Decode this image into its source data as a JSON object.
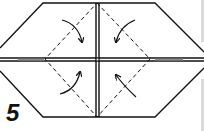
{
  "diagram": {
    "step_number": "5",
    "colors": {
      "line": "#111111",
      "background": "#ffffff",
      "edge_bar": "#d9d9d9"
    },
    "elements": {
      "outline": "hexagon",
      "crease_lines": [
        "vertical-center",
        "horizontal-center"
      ],
      "dashed_fold_lines": "diamond",
      "arrows": [
        "top-left-inward",
        "top-right-inward",
        "bottom-left-inward",
        "bottom-right-inward"
      ]
    }
  }
}
